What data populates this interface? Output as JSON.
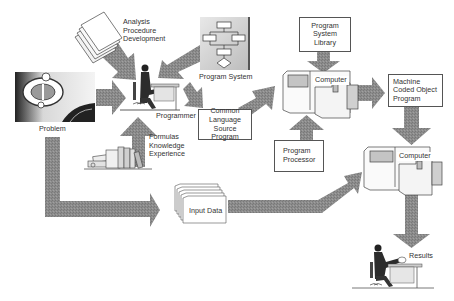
{
  "diagram": {
    "type": "flow",
    "colors": {
      "arrow": "#8a8a8a",
      "arrow_dark": "#6e6e6e",
      "box_border": "#555555",
      "text": "#333333",
      "panel_shade": "#bdbdbd"
    },
    "nodes": {
      "problem": {
        "label": "Problem"
      },
      "analysis": {
        "lines": [
          "Analysis",
          "Procedure",
          "Development"
        ]
      },
      "programmer": {
        "label": "Programmer"
      },
      "program_system": {
        "label": "Program System"
      },
      "formulas": {
        "lines": [
          "Formulas",
          "Knowledge",
          "Experience"
        ]
      },
      "source_program": {
        "lines": [
          "Common",
          "Language",
          "Source Program"
        ]
      },
      "library": {
        "lines": [
          "Program System",
          "Library"
        ]
      },
      "computer_1": {
        "label": "Computer"
      },
      "program_processor": {
        "lines": [
          "Program",
          "Processor"
        ]
      },
      "object_program": {
        "lines": [
          "Machine",
          "Coded Object",
          "Program"
        ]
      },
      "computer_2": {
        "label": "Computer"
      },
      "input_data": {
        "label": "Input Data"
      },
      "results": {
        "label": "Results"
      }
    },
    "edges": [
      {
        "from": "analysis",
        "to": "programmer"
      },
      {
        "from": "program_system",
        "to": "programmer"
      },
      {
        "from": "problem",
        "to": "programmer"
      },
      {
        "from": "formulas",
        "to": "programmer"
      },
      {
        "from": "programmer",
        "to": "source_program"
      },
      {
        "from": "source_program",
        "to": "computer_1"
      },
      {
        "from": "library",
        "to": "computer_1"
      },
      {
        "from": "program_processor",
        "to": "computer_1"
      },
      {
        "from": "computer_1",
        "to": "object_program"
      },
      {
        "from": "object_program",
        "to": "computer_2"
      },
      {
        "from": "problem",
        "to": "input_data"
      },
      {
        "from": "input_data",
        "to": "computer_2"
      },
      {
        "from": "computer_2",
        "to": "results"
      }
    ]
  }
}
